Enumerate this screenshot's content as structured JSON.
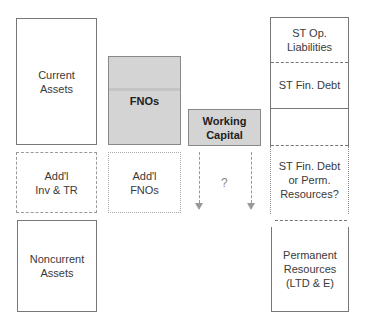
{
  "diagram": {
    "assets_column": {
      "current_assets": "Current\nAssets",
      "additional_inv_tr": "Add'l\nInv & TR",
      "noncurrent_assets": "Noncurrent\nAssets"
    },
    "fnos_column": {
      "fnos": "FNOs",
      "additional_fnos": "Add'l\nFNOs"
    },
    "working_capital_column": {
      "working_capital": "Working\nCapital",
      "question": "?"
    },
    "liabilities_column": {
      "st_op_liabilities": "ST Op.\nLiabilities",
      "st_fin_debt": "ST Fin. Debt",
      "st_fin_debt_or_perm": "ST Fin. Debt\nor Perm.\nResources?",
      "permanent_resources": "Permanent\nResources\n(LTD & E)"
    },
    "colors": {
      "highlight_fill": "#d4d4d4",
      "border": "#777777",
      "dashed": "#999999"
    }
  }
}
